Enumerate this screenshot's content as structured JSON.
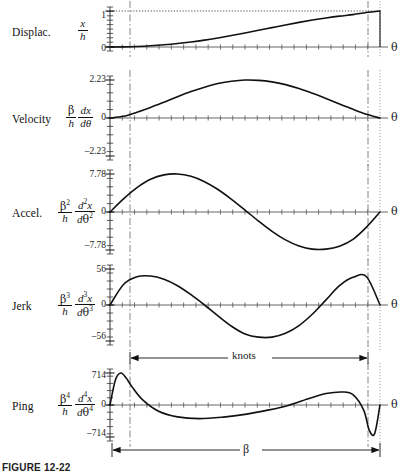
{
  "figure": {
    "caption": "FIGURE 12-22",
    "theta_axis_label": "θ",
    "span_knots_label": "knots",
    "span_beta_label": "β"
  },
  "rows": [
    {
      "id": "displacement",
      "name": "Displac.",
      "formula": {
        "prefix": "",
        "num": "x",
        "den": "h",
        "num_sup": "",
        "den_sup": "",
        "second_num": "",
        "second_den": ""
      },
      "ticks": [
        "1",
        "0"
      ],
      "axis_label": "θ"
    },
    {
      "id": "velocity",
      "name": "Velocity",
      "formula": {
        "prefix": "",
        "num": "β",
        "den": "h",
        "num_sup": "",
        "den_sup": "",
        "second_num": "dx",
        "second_den": "dθ"
      },
      "ticks": [
        "2.23",
        "0",
        "–2.23"
      ],
      "axis_label": "θ"
    },
    {
      "id": "acceleration",
      "name": "Accel.",
      "formula": {
        "prefix": "",
        "num": "β",
        "den": "h",
        "num_sup": "2",
        "den_sup": "",
        "second_num": "d x",
        "second_den": "dθ",
        "second_num_sup": "2",
        "second_den_sup": "2"
      },
      "ticks": [
        "7.78",
        "0",
        "–7.78"
      ],
      "axis_label": "θ"
    },
    {
      "id": "jerk",
      "name": "Jerk",
      "formula": {
        "prefix": "",
        "num": "β",
        "den": "h",
        "num_sup": "3",
        "den_sup": "",
        "second_num": "d x",
        "second_den": "dθ",
        "second_num_sup": "3",
        "second_den_sup": "3"
      },
      "ticks": [
        "56",
        "0",
        "–56"
      ],
      "axis_label": "θ"
    },
    {
      "id": "ping",
      "name": "Ping",
      "formula": {
        "prefix": "",
        "num": "β",
        "den": "h",
        "num_sup": "4",
        "den_sup": "",
        "second_num": "d x",
        "second_den": "dθ",
        "second_num_sup": "4",
        "second_den_sup": "4"
      },
      "ticks": [
        "714",
        "0",
        "–714"
      ],
      "axis_label": "θ"
    }
  ],
  "chart_data": {
    "type": "line",
    "title": "",
    "xlabel": "θ",
    "ylabel": "",
    "grid": false,
    "legend": "none",
    "x_domain": [
      0,
      1
    ],
    "knots_span": [
      0.07,
      0.96
    ],
    "beta_span": [
      0.0,
      1.0
    ],
    "panels": [
      {
        "name": "Displac.",
        "ylabel": "x / h",
        "ylim": [
          0,
          1
        ],
        "yticks": [
          0,
          1
        ],
        "ytick_labels": [
          "0",
          "1"
        ],
        "description": "Smooth S-curve rise from 0 to 1 (modified sine / polynomial rise).",
        "x": [
          0.0,
          0.05,
          0.1,
          0.15,
          0.2,
          0.25,
          0.3,
          0.35,
          0.4,
          0.45,
          0.5,
          0.55,
          0.6,
          0.65,
          0.7,
          0.75,
          0.8,
          0.85,
          0.9,
          0.95,
          1.0
        ],
        "y": [
          0.0,
          0.004,
          0.015,
          0.034,
          0.061,
          0.096,
          0.14,
          0.192,
          0.252,
          0.318,
          0.389,
          0.463,
          0.538,
          0.612,
          0.683,
          0.748,
          0.806,
          0.857,
          0.9,
          0.957,
          1.0
        ]
      },
      {
        "name": "Velocity",
        "ylabel": "(β/h) dx/dθ",
        "ylim": [
          -2.23,
          2.23
        ],
        "yticks": [
          -2.23,
          0,
          2.23
        ],
        "ytick_labels": [
          "–2.23",
          "0",
          "2.23"
        ],
        "description": "Single positive hump peaking near 2.23 around mid-stroke, zero at both ends.",
        "x": [
          0.0,
          0.05,
          0.1,
          0.15,
          0.2,
          0.25,
          0.3,
          0.35,
          0.4,
          0.45,
          0.5,
          0.55,
          0.6,
          0.65,
          0.7,
          0.75,
          0.8,
          0.85,
          0.9,
          0.95,
          1.0
        ],
        "y": [
          0.0,
          0.1,
          0.34,
          0.62,
          0.93,
          1.25,
          1.55,
          1.81,
          2.02,
          2.16,
          2.23,
          2.21,
          2.12,
          1.96,
          1.73,
          1.45,
          1.14,
          0.82,
          0.51,
          0.22,
          0.0
        ]
      },
      {
        "name": "Accel.",
        "ylabel": "(β²/h) d²x/dθ²",
        "ylim": [
          -7.78,
          7.78
        ],
        "yticks": [
          -7.78,
          0,
          7.78
        ],
        "ytick_labels": [
          "–7.78",
          "0",
          "7.78"
        ],
        "description": "Full sine cycle: positive lobe peaking 7.78 near 25%, crossing zero near 52%, negative lobe reaching –7.78 near 78%, returning toward 0 at end.",
        "x": [
          0.0,
          0.05,
          0.1,
          0.15,
          0.2,
          0.25,
          0.3,
          0.35,
          0.4,
          0.45,
          0.5,
          0.55,
          0.6,
          0.65,
          0.7,
          0.75,
          0.8,
          0.85,
          0.9,
          0.95,
          1.0
        ],
        "y": [
          0.0,
          2.7,
          5.0,
          6.7,
          7.6,
          7.78,
          7.3,
          6.2,
          4.6,
          2.6,
          0.4,
          -1.85,
          -3.95,
          -5.7,
          -6.95,
          -7.6,
          -7.6,
          -7.0,
          -5.6,
          -3.1,
          0.0
        ]
      },
      {
        "name": "Jerk",
        "ylabel": "(β³/h) d³x/dθ³",
        "ylim": [
          -56,
          56
        ],
        "yticks": [
          -56,
          0,
          56
        ],
        "ytick_labels": [
          "–56",
          "0",
          "56"
        ],
        "description": "Rises quickly to about +45, falls through zero near 33%, trough about –50 near 58%, rises to about +45 near 90%, drops to 0 at end.",
        "x": [
          0.0,
          0.05,
          0.1,
          0.15,
          0.2,
          0.25,
          0.3,
          0.35,
          0.4,
          0.45,
          0.5,
          0.55,
          0.6,
          0.65,
          0.7,
          0.75,
          0.8,
          0.85,
          0.9,
          0.95,
          1.0
        ],
        "y": [
          0.0,
          32.0,
          44.0,
          45.0,
          40.0,
          30.0,
          16.0,
          0.0,
          -17.0,
          -33.0,
          -45.0,
          -50.0,
          -50.0,
          -44.0,
          -32.0,
          -14.0,
          8.0,
          30.0,
          43.0,
          44.0,
          0.0
        ]
      },
      {
        "name": "Ping",
        "ylabel": "(β⁴/h) d⁴x/dθ⁴",
        "ylim": [
          -714,
          714
        ],
        "yticks": [
          -714,
          0,
          714
        ],
        "ytick_labels": [
          "–714",
          "0",
          "714"
        ],
        "description": "Sharp positive spike to 714 immediately after start, decays through zero near 12%, broad trough near –300 around 33%, rises to about +290 near 80%, then sharp negative spike to about –640 near 96% before snapping back to 0.",
        "x": [
          0.0,
          0.02,
          0.04,
          0.06,
          0.08,
          0.12,
          0.18,
          0.25,
          0.33,
          0.42,
          0.5,
          0.58,
          0.66,
          0.74,
          0.8,
          0.86,
          0.9,
          0.94,
          0.96,
          0.98,
          1.0
        ],
        "y": [
          0.0,
          560.0,
          714.0,
          600.0,
          420.0,
          120.0,
          -140.0,
          -265.0,
          -305.0,
          -270.0,
          -210.0,
          -120.0,
          -10.0,
          150.0,
          255.0,
          290.0,
          230.0,
          -120.0,
          -560.0,
          -640.0,
          0.0
        ]
      }
    ]
  }
}
